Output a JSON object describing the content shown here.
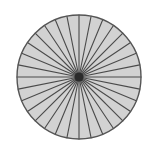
{
  "figure": {
    "name": "sectored-circle",
    "background_color": "#ffffff",
    "canvas": {
      "width": 157,
      "height": 155
    }
  },
  "chart_data": {
    "type": "pie",
    "title": "",
    "subtitle": "",
    "xlabel": "",
    "ylabel": "",
    "legend": [],
    "annotations": [],
    "grid": false,
    "labels_shown": false,
    "slice_count": 32,
    "categories": [
      "1",
      "2",
      "3",
      "4",
      "5",
      "6",
      "7",
      "8",
      "9",
      "10",
      "11",
      "12",
      "13",
      "14",
      "15",
      "16",
      "17",
      "18",
      "19",
      "20",
      "21",
      "22",
      "23",
      "24",
      "25",
      "26",
      "27",
      "28",
      "29",
      "30",
      "31",
      "32"
    ],
    "values": [
      1,
      1,
      1,
      1,
      1,
      1,
      1,
      1,
      1,
      1,
      1,
      1,
      1,
      1,
      1,
      1,
      1,
      1,
      1,
      1,
      1,
      1,
      1,
      1,
      1,
      1,
      1,
      1,
      1,
      1,
      1,
      1
    ],
    "slice_fraction": "1/32",
    "slice_angle_degrees": 11.25,
    "start_angle_degrees": -90,
    "total": 32,
    "geometry": {
      "center_x": 79,
      "center_y": 77,
      "radius": 62
    },
    "style": {
      "slice_fill": "#d2d2d2",
      "slice_stroke": "#4a4a4a",
      "outer_stroke": "#555555",
      "outer_stroke_width": 1.4,
      "spoke_stroke_width": 1.1,
      "hub_fill": "#2b2b2b",
      "hub_radius": 4.5
    }
  }
}
